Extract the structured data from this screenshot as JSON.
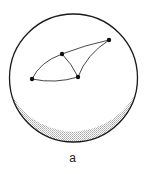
{
  "figure": {
    "caption": "a",
    "sphere": {
      "cx": 73.5,
      "cy": 78,
      "r": 64,
      "stroke": "#1a1a1a",
      "shade_color": "#c8c8c8"
    },
    "vertices": [
      {
        "id": "v1",
        "x": 109,
        "y": 40
      },
      {
        "id": "v2",
        "x": 62,
        "y": 54
      },
      {
        "id": "v3",
        "x": 32,
        "y": 79
      },
      {
        "id": "v4",
        "x": 78,
        "y": 77
      }
    ],
    "edges": [
      {
        "from": "v1",
        "to": "v2"
      },
      {
        "from": "v2",
        "to": "v3"
      },
      {
        "from": "v3",
        "to": "v4"
      },
      {
        "from": "v2",
        "to": "v4"
      },
      {
        "from": "v1",
        "to": "v4"
      }
    ]
  }
}
